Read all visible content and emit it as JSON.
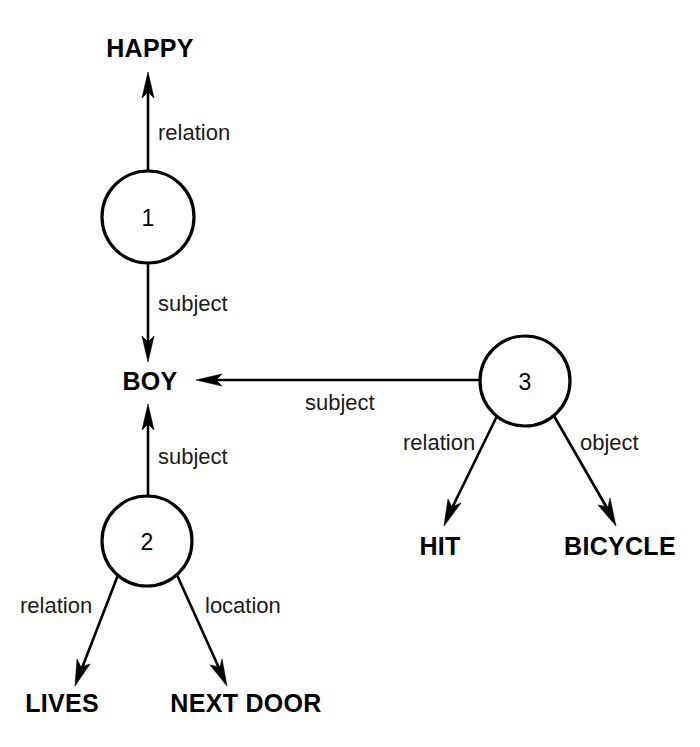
{
  "diagram": {
    "type": "semantic-network",
    "title": "",
    "concepts": [
      {
        "id": "happy",
        "label": "HAPPY",
        "x": 150,
        "y": 57,
        "anchor": "middle"
      },
      {
        "id": "boy",
        "label": "BOY",
        "x": 150,
        "y": 390,
        "anchor": "middle"
      },
      {
        "id": "lives",
        "label": "LIVES",
        "x": 62,
        "y": 712,
        "anchor": "middle"
      },
      {
        "id": "next-door",
        "label": "NEXT DOOR",
        "x": 246,
        "y": 712,
        "anchor": "middle"
      },
      {
        "id": "hit",
        "label": "HIT",
        "x": 440,
        "y": 555,
        "anchor": "middle"
      },
      {
        "id": "bicycle",
        "label": "BICYCLE",
        "x": 620,
        "y": 555,
        "anchor": "middle"
      }
    ],
    "nodes": [
      {
        "id": "node-1",
        "number": "1",
        "cx": 148,
        "cy": 217,
        "r": 46
      },
      {
        "id": "node-2",
        "number": "2",
        "cx": 147,
        "cy": 541,
        "r": 45
      },
      {
        "id": "node-3",
        "number": "3",
        "cx": 525,
        "cy": 381,
        "r": 45
      }
    ],
    "edges": [
      {
        "id": "e1-happy",
        "from": "node-1",
        "to": "happy",
        "label": "relation",
        "lx": 158,
        "ly": 140
      },
      {
        "id": "e1-boy",
        "from": "node-1",
        "to": "boy",
        "label": "subject",
        "lx": 158,
        "ly": 311
      },
      {
        "id": "e2-boy",
        "from": "node-2",
        "to": "boy",
        "label": "subject",
        "lx": 158,
        "ly": 464
      },
      {
        "id": "e2-lives",
        "from": "node-2",
        "to": "lives",
        "label": "relation",
        "lx": 20,
        "ly": 613
      },
      {
        "id": "e2-nextdoor",
        "from": "node-2",
        "to": "next-door",
        "label": "location",
        "lx": 205,
        "ly": 613
      },
      {
        "id": "e3-boy",
        "from": "node-3",
        "to": "boy",
        "label": "subject",
        "lx": 305,
        "ly": 410
      },
      {
        "id": "e3-hit",
        "from": "node-3",
        "to": "hit",
        "label": "relation",
        "lx": 403,
        "ly": 450
      },
      {
        "id": "e3-bicycle",
        "from": "node-3",
        "to": "bicycle",
        "label": "object",
        "lx": 580,
        "ly": 450
      }
    ],
    "colors": {
      "stroke": "#000000",
      "background": "#ffffff",
      "text": "#000000"
    }
  }
}
